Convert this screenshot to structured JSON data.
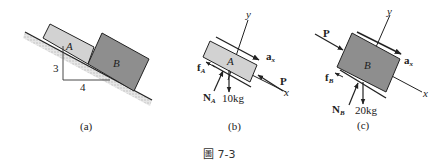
{
  "figure": {
    "caption": "圖 7-3",
    "panels": [
      {
        "id": "a",
        "label": "(a)",
        "block_a": "A",
        "block_b": "B",
        "slope_rise": "3",
        "slope_run": "4"
      },
      {
        "id": "b",
        "label": "(b)",
        "block": "A",
        "axis_x": "x",
        "axis_y": "y",
        "accel": "a",
        "accel_sub": "x",
        "friction": "f",
        "friction_sub": "A",
        "normal": "N",
        "normal_sub": "A",
        "weight": "10kg",
        "force": "P"
      },
      {
        "id": "c",
        "label": "(c)",
        "block": "B",
        "axis_x": "x",
        "axis_y": "y",
        "accel": "a",
        "accel_sub": "x",
        "friction": "f",
        "friction_sub": "B",
        "normal": "N",
        "normal_sub": "B",
        "weight": "20kg",
        "force": "P"
      }
    ],
    "colors": {
      "block_a_fill": "#d2d2d2",
      "block_b_fill": "#8e8e8e",
      "ground_hatch": "#c8c8c8",
      "line": "#222222"
    }
  }
}
